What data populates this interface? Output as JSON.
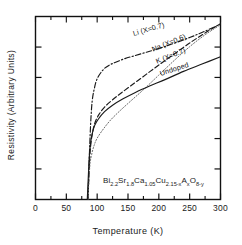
{
  "chart_data": {
    "type": "line",
    "title": "",
    "xlabel": "Temperature  (K)",
    "ylabel": "Resistivity  (Arbitrary Units)",
    "xlim": [
      0,
      300
    ],
    "ylim": [
      0,
      1.0
    ],
    "xticks": [
      0,
      50,
      100,
      150,
      200,
      250,
      300
    ],
    "xtick_labels": [
      "0",
      "50",
      "100",
      "150",
      "200",
      "250",
      "300"
    ],
    "xminor_step": 25,
    "yticks": [
      0.167,
      0.333,
      0.5,
      0.667,
      0.833
    ],
    "ytick_labels": [
      "",
      "",
      "",
      "",
      ""
    ],
    "grid": false,
    "legend_position": "inline-along-curves",
    "annotation": "Bi2.2Sr1.8Ca1.05Cu2.15-xAxO8-y",
    "series": [
      {
        "name": "Li (X=0.7)",
        "linestyle": "dashdot",
        "color": "#1a1a1a",
        "x": [
          85,
          88,
          90,
          92,
          95,
          100,
          110,
          120,
          130,
          145,
          160,
          180,
          200,
          220,
          250,
          275,
          300
        ],
        "values": [
          0.0,
          0.3,
          0.45,
          0.54,
          0.6,
          0.66,
          0.71,
          0.735,
          0.75,
          0.77,
          0.785,
          0.805,
          0.825,
          0.848,
          0.885,
          0.92,
          0.958
        ]
      },
      {
        "name": "Na (X=0.6)",
        "linestyle": "dashed",
        "color": "#1a1a1a",
        "x": [
          85,
          88,
          90,
          93,
          97,
          103,
          112,
          125,
          140,
          160,
          180,
          200,
          225,
          250,
          275,
          300
        ],
        "values": [
          0.0,
          0.23,
          0.31,
          0.375,
          0.425,
          0.465,
          0.505,
          0.545,
          0.585,
          0.635,
          0.685,
          0.735,
          0.795,
          0.855,
          0.91,
          0.96
        ]
      },
      {
        "name": "K (X=0.7)",
        "linestyle": "dotted",
        "color": "#6b6b6b",
        "x": [
          85,
          88,
          91,
          95,
          100,
          110,
          122,
          137,
          155,
          175,
          200,
          225,
          250,
          275,
          300
        ],
        "values": [
          0.0,
          0.18,
          0.245,
          0.295,
          0.335,
          0.385,
          0.435,
          0.485,
          0.54,
          0.6,
          0.68,
          0.76,
          0.835,
          0.9,
          0.955
        ]
      },
      {
        "name": "Undoped",
        "linestyle": "solid",
        "color": "#1a1a1a",
        "x": [
          84,
          87,
          89,
          92,
          96,
          102,
          112,
          125,
          142,
          162,
          185,
          210,
          240,
          270,
          300
        ],
        "values": [
          0.0,
          0.22,
          0.3,
          0.36,
          0.405,
          0.44,
          0.48,
          0.515,
          0.55,
          0.585,
          0.62,
          0.655,
          0.7,
          0.74,
          0.78
        ]
      }
    ],
    "curve_label_positions": [
      {
        "name": "Li (X=0.7)",
        "left": 133,
        "top": 29,
        "rotate": -16
      },
      {
        "name": "Na (X=0.6)",
        "left": 152,
        "top": 45,
        "rotate": -22
      },
      {
        "name": "K (X=0.7)",
        "left": 156,
        "top": 57,
        "rotate": -22
      },
      {
        "name": "Undoped",
        "left": 160,
        "top": 69,
        "rotate": -18
      }
    ]
  },
  "formula": {
    "parts": [
      {
        "t": "Bi",
        "sub": false
      },
      {
        "t": "2.2",
        "sub": true
      },
      {
        "t": "Sr",
        "sub": false
      },
      {
        "t": "1.8",
        "sub": true
      },
      {
        "t": "Ca",
        "sub": false
      },
      {
        "t": "1.05",
        "sub": true
      },
      {
        "t": "Cu",
        "sub": false
      },
      {
        "t": "2.15-x",
        "sub": true
      },
      {
        "t": "A",
        "sub": false
      },
      {
        "t": "x",
        "sub": true
      },
      {
        "t": "O",
        "sub": false
      },
      {
        "t": "8-y",
        "sub": true
      }
    ]
  }
}
